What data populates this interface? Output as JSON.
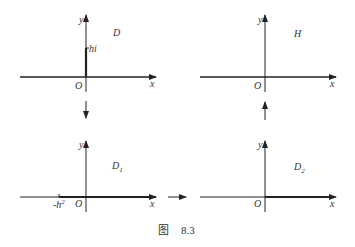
{
  "panels": {
    "D": {
      "region": "D",
      "x_label": "x",
      "y_label": "y",
      "origin": "O",
      "mark": "hi"
    },
    "H": {
      "region": "H",
      "x_label": "x",
      "y_label": "y",
      "origin": "O"
    },
    "D1": {
      "region": "D",
      "region_sub": "1",
      "x_label": "x",
      "y_label": "y",
      "origin": "O",
      "mark": "-h",
      "mark_sup": "2"
    },
    "D2": {
      "region": "D",
      "region_sub": "2",
      "x_label": "x",
      "y_label": "y",
      "origin": "O"
    }
  },
  "caption": {
    "prefix": "图",
    "number": "8.3"
  },
  "colors": {
    "axis": "#222222",
    "text": "#333333"
  }
}
